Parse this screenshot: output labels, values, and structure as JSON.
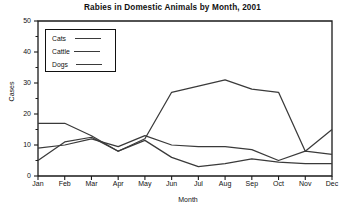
{
  "chart_data": {
    "type": "line",
    "title": "Rabies in Domestic Animals by Month, 2001",
    "xlabel": "Month",
    "ylabel": "Cases",
    "categories": [
      "Jan",
      "Feb",
      "Mar",
      "Apr",
      "May",
      "Jun",
      "Jul",
      "Aug",
      "Sep",
      "Oct",
      "Nov",
      "Dec"
    ],
    "ylim": [
      0,
      50
    ],
    "yticks": [
      0,
      10,
      20,
      30,
      40,
      50
    ],
    "yticks_minor": [
      5,
      15,
      25,
      35,
      45
    ],
    "grid": false,
    "legend_position": "upper-left",
    "series": [
      {
        "name": "Cats",
        "values": [
          5,
          11,
          12.5,
          8,
          12,
          27,
          29,
          31,
          28,
          27,
          8,
          15
        ]
      },
      {
        "name": "Cattle",
        "values": [
          9,
          10,
          12,
          9.5,
          13,
          10,
          9.5,
          9.5,
          8.5,
          5,
          8,
          7
        ]
      },
      {
        "name": "Dogs",
        "values": [
          17,
          17,
          13,
          8,
          11.5,
          6,
          3,
          4,
          5.5,
          4.5,
          4,
          4
        ]
      }
    ]
  },
  "legend": {
    "items": [
      {
        "label": "Cats"
      },
      {
        "label": "Cattle"
      },
      {
        "label": "Dogs"
      }
    ]
  },
  "caption": {
    "ghost_text": ""
  }
}
